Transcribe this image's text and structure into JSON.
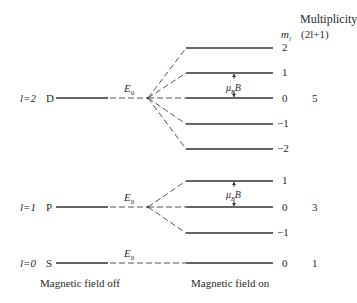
{
  "header": {
    "multiplicity_label": "Multiplicity",
    "ml_label": "m",
    "ml_sub": "l",
    "formula_label": "(2l+1)"
  },
  "levels": [
    {
      "l_label": "l=2",
      "term": "D",
      "energy_label": "E",
      "energy_sub": "0",
      "splitting_label": "μ",
      "splitting_sub": "B",
      "splitting_tail": "B",
      "ml_values": [
        "2",
        "1",
        "0",
        "−1",
        "−2"
      ],
      "multiplicity": "5"
    },
    {
      "l_label": "l=1",
      "term": "P",
      "energy_label": "E",
      "energy_sub": "0",
      "splitting_label": "μ",
      "splitting_sub": "B",
      "splitting_tail": "B",
      "ml_values": [
        "1",
        "0",
        "−1"
      ],
      "multiplicity": "3"
    },
    {
      "l_label": "l=0",
      "term": "S",
      "energy_label": "E",
      "energy_sub": "0",
      "ml_values": [
        "0"
      ],
      "multiplicity": "1"
    }
  ],
  "footer": {
    "field_off": "Magnetic field off",
    "field_on": "Magnetic field on"
  },
  "colors": {
    "line": "#333333",
    "dash": "#555555",
    "text": "#2a2a2a"
  }
}
